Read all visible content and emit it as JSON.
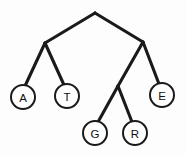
{
  "figure": {
    "background_color": "#fdfdfd",
    "line_color": "#1a1a1a",
    "node_fill_color": "#ffffff",
    "node_stroke_color": "#1a1a1a",
    "label_color": "#111111",
    "width": 187,
    "height": 155
  },
  "tree": {
    "node_radius": 12,
    "vertices": [
      {
        "id": "root",
        "label": "",
        "x": 95,
        "y": 13,
        "shape": "apex",
        "labeled": false
      },
      {
        "id": "int-left",
        "label": "",
        "x": 45,
        "y": 43,
        "shape": "apex",
        "labeled": false
      },
      {
        "id": "int-right",
        "label": "",
        "x": 143,
        "y": 42,
        "shape": "apex",
        "labeled": false
      },
      {
        "id": "int-mid",
        "label": "",
        "x": 118,
        "y": 86,
        "shape": "apex",
        "labeled": false
      },
      {
        "id": "leaf-a",
        "label": "A",
        "x": 23,
        "y": 97,
        "shape": "circle",
        "labeled": true
      },
      {
        "id": "leaf-t",
        "label": "T",
        "x": 67,
        "y": 96,
        "shape": "circle",
        "labeled": true
      },
      {
        "id": "leaf-g",
        "label": "G",
        "x": 95,
        "y": 133,
        "shape": "circle",
        "labeled": true
      },
      {
        "id": "leaf-r",
        "label": "R",
        "x": 135,
        "y": 133,
        "shape": "circle",
        "labeled": true
      },
      {
        "id": "leaf-e",
        "label": "E",
        "x": 162,
        "y": 95,
        "shape": "circle",
        "labeled": true
      }
    ],
    "edges": [
      {
        "id": "edge-root-left",
        "from": "root",
        "to": "int-left",
        "x1": 95,
        "y1": 13,
        "x2": 45,
        "y2": 43
      },
      {
        "id": "edge-root-right",
        "from": "root",
        "to": "int-right",
        "x1": 95,
        "y1": 13,
        "x2": 143,
        "y2": 42
      },
      {
        "id": "edge-left-a",
        "from": "int-left",
        "to": "leaf-a",
        "x1": 45,
        "y1": 43,
        "x2": 25,
        "y2": 86
      },
      {
        "id": "edge-left-t",
        "from": "int-left",
        "to": "leaf-t",
        "x1": 45,
        "y1": 43,
        "x2": 64,
        "y2": 85
      },
      {
        "id": "edge-right-mid",
        "from": "int-right",
        "to": "int-mid",
        "x1": 143,
        "y1": 42,
        "x2": 118,
        "y2": 86
      },
      {
        "id": "edge-right-e",
        "from": "int-right",
        "to": "leaf-e",
        "x1": 143,
        "y1": 42,
        "x2": 159,
        "y2": 84
      },
      {
        "id": "edge-mid-g",
        "from": "int-mid",
        "to": "leaf-g",
        "x1": 118,
        "y1": 86,
        "x2": 98,
        "y2": 122
      },
      {
        "id": "edge-mid-r",
        "from": "int-mid",
        "to": "leaf-r",
        "x1": 118,
        "y1": 86,
        "x2": 132,
        "y2": 122
      }
    ],
    "leaf_labels": [
      "A",
      "T",
      "G",
      "R",
      "E"
    ]
  }
}
